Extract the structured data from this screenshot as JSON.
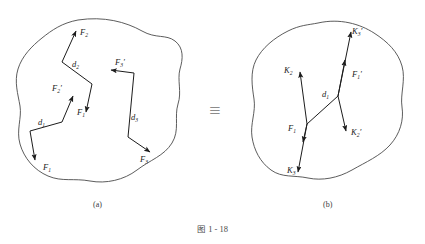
{
  "figure": {
    "caption": "图 1 - 18",
    "equivalence_symbol": "≡",
    "panels": [
      {
        "id": "a",
        "label": "(a)",
        "description": "rigid body with three forces and their equal-and-opposite counterparts separated by moment arms",
        "forces": [
          {
            "name": "F2",
            "label_main": "F",
            "label_sub": "2",
            "label_prime": "",
            "direction": "up-right"
          },
          {
            "name": "F2p",
            "label_main": "F",
            "label_sub": "2",
            "label_prime": "′",
            "direction": "down-right"
          },
          {
            "name": "F1p",
            "label_main": "F",
            "label_sub": "1",
            "label_prime": "′",
            "direction": "up-right"
          },
          {
            "name": "F1",
            "label_main": "F",
            "label_sub": "1",
            "label_prime": "",
            "direction": "down"
          },
          {
            "name": "F3p",
            "label_main": "F",
            "label_sub": "3",
            "label_prime": "′",
            "direction": "left"
          },
          {
            "name": "F3",
            "label_main": "F",
            "label_sub": "3",
            "label_prime": "",
            "direction": "right"
          }
        ],
        "arms": [
          {
            "name": "d1",
            "label_main": "d",
            "label_sub": "1"
          },
          {
            "name": "d2",
            "label_main": "d",
            "label_sub": "2"
          },
          {
            "name": "d3",
            "label_main": "d",
            "label_sub": "3"
          }
        ]
      },
      {
        "id": "b",
        "label": "(b)",
        "description": "equivalent rigid body with a single resultant couple",
        "forces": [
          {
            "name": "K3p",
            "label_main": "K",
            "label_sub": "3",
            "label_prime": "′",
            "direction": "up-right"
          },
          {
            "name": "K2",
            "label_main": "K",
            "label_sub": "2",
            "label_prime": "",
            "direction": "up-left"
          },
          {
            "name": "F1p",
            "label_main": "F",
            "label_sub": "1",
            "label_prime": "′",
            "direction": "up-right"
          },
          {
            "name": "F1",
            "label_main": "F",
            "label_sub": "1",
            "label_prime": "",
            "direction": "down"
          },
          {
            "name": "K2p",
            "label_main": "K",
            "label_sub": "2",
            "label_prime": "′",
            "direction": "down-right"
          },
          {
            "name": "K3",
            "label_main": "K",
            "label_sub": "3",
            "label_prime": "",
            "direction": "down"
          }
        ],
        "arms": [
          {
            "name": "d1",
            "label_main": "d",
            "label_sub": "1"
          }
        ]
      }
    ]
  },
  "colors": {
    "outline": "#4a4a4a",
    "vector": "#1c1c1c",
    "label": "#1c1c1c",
    "caption": "#4a4a4a",
    "equiv": "#8c8c8c",
    "background": "#ffffff"
  }
}
